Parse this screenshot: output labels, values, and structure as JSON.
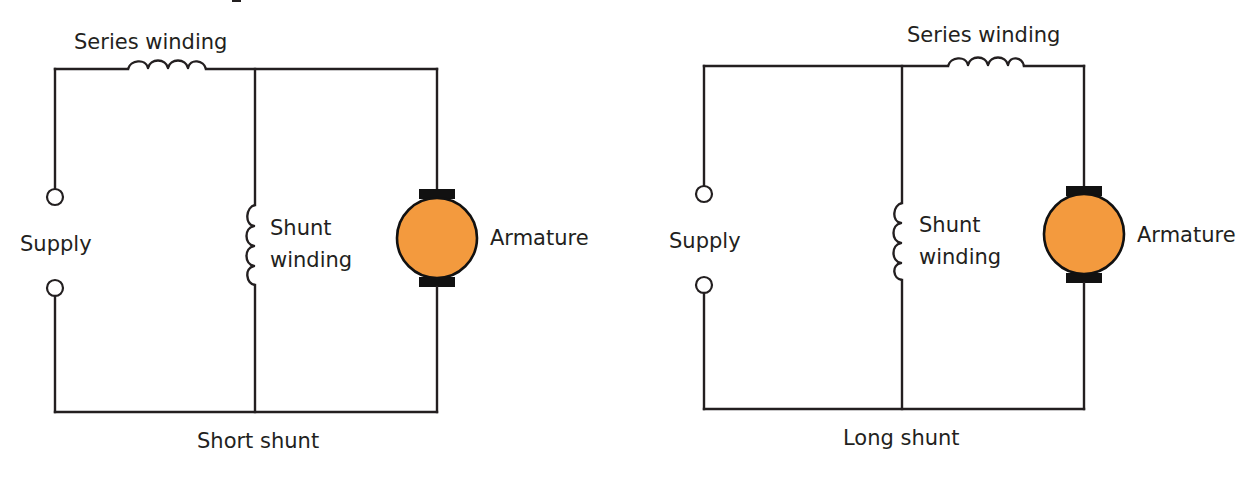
{
  "colors": {
    "line": "#231f20",
    "armature_fill": "#f39a3e",
    "brush": "#111111",
    "background": "#ffffff"
  },
  "diagrams": [
    {
      "id": "short-shunt",
      "caption": "Short shunt",
      "labels": {
        "series": "Series winding",
        "supply": "Supply",
        "shunt_line1": "Shunt",
        "shunt_line2": "winding",
        "armature": "Armature"
      }
    },
    {
      "id": "long-shunt",
      "caption": "Long shunt",
      "labels": {
        "series": "Series winding",
        "supply": "Supply",
        "shunt_line1": "Shunt",
        "shunt_line2": "winding",
        "armature": "Armature"
      }
    }
  ]
}
